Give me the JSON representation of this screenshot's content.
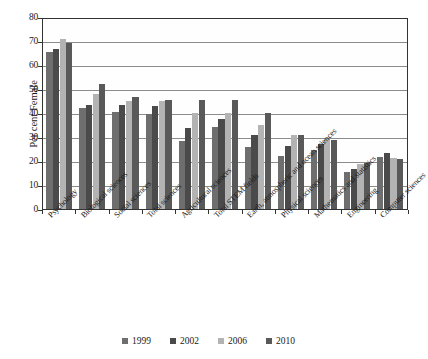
{
  "chart_data": {
    "type": "bar",
    "title": "",
    "subtitle": "",
    "xlabel": "",
    "ylabel": "Per cent Female",
    "ylim": [
      0,
      80
    ],
    "ytick_step": 10,
    "yticks": [
      "0",
      "10",
      "20",
      "30",
      "40",
      "50",
      "60",
      "70",
      "80"
    ],
    "grid": true,
    "grid_axis": "y",
    "legend_position": "bottom",
    "categories": [
      "Psychology",
      "Biological sciences",
      "Social sciences",
      "Total sciences",
      "Agricultural sciences",
      "Total STEM fields",
      "Earth, atmospheric and ocean sciences",
      "Physical sciences",
      "Mathematics and statistics",
      "Engineering",
      "Computer sciences"
    ],
    "series": [
      {
        "name": "1999",
        "color": "#6e6e6e",
        "values": [
          66.0,
          42.5,
          41.0,
          40.0,
          28.5,
          34.5,
          26.0,
          22.5,
          25.0,
          15.5,
          22.0
        ]
      },
      {
        "name": "2002",
        "color": "#4a4a4a",
        "values": [
          67.5,
          44.0,
          44.0,
          43.5,
          34.0,
          38.0,
          31.0,
          26.5,
          27.5,
          17.0,
          23.5
        ]
      },
      {
        "name": "2006",
        "color": "#b3b3b3",
        "values": [
          71.5,
          48.5,
          45.5,
          45.5,
          40.5,
          40.5,
          35.5,
          31.0,
          29.5,
          19.0,
          21.5
        ]
      },
      {
        "name": "2010",
        "color": "#595959",
        "values": [
          70.0,
          52.5,
          47.0,
          46.0,
          46.0,
          46.0,
          40.5,
          31.0,
          29.0,
          19.5,
          21.0
        ]
      }
    ]
  },
  "axis": {
    "y_title": "Per cent Female"
  },
  "legend": {
    "items": [
      {
        "label": "1999",
        "color": "#6e6e6e"
      },
      {
        "label": "2002",
        "color": "#4a4a4a"
      },
      {
        "label": "2006",
        "color": "#b3b3b3"
      },
      {
        "label": "2010",
        "color": "#595959"
      }
    ]
  }
}
